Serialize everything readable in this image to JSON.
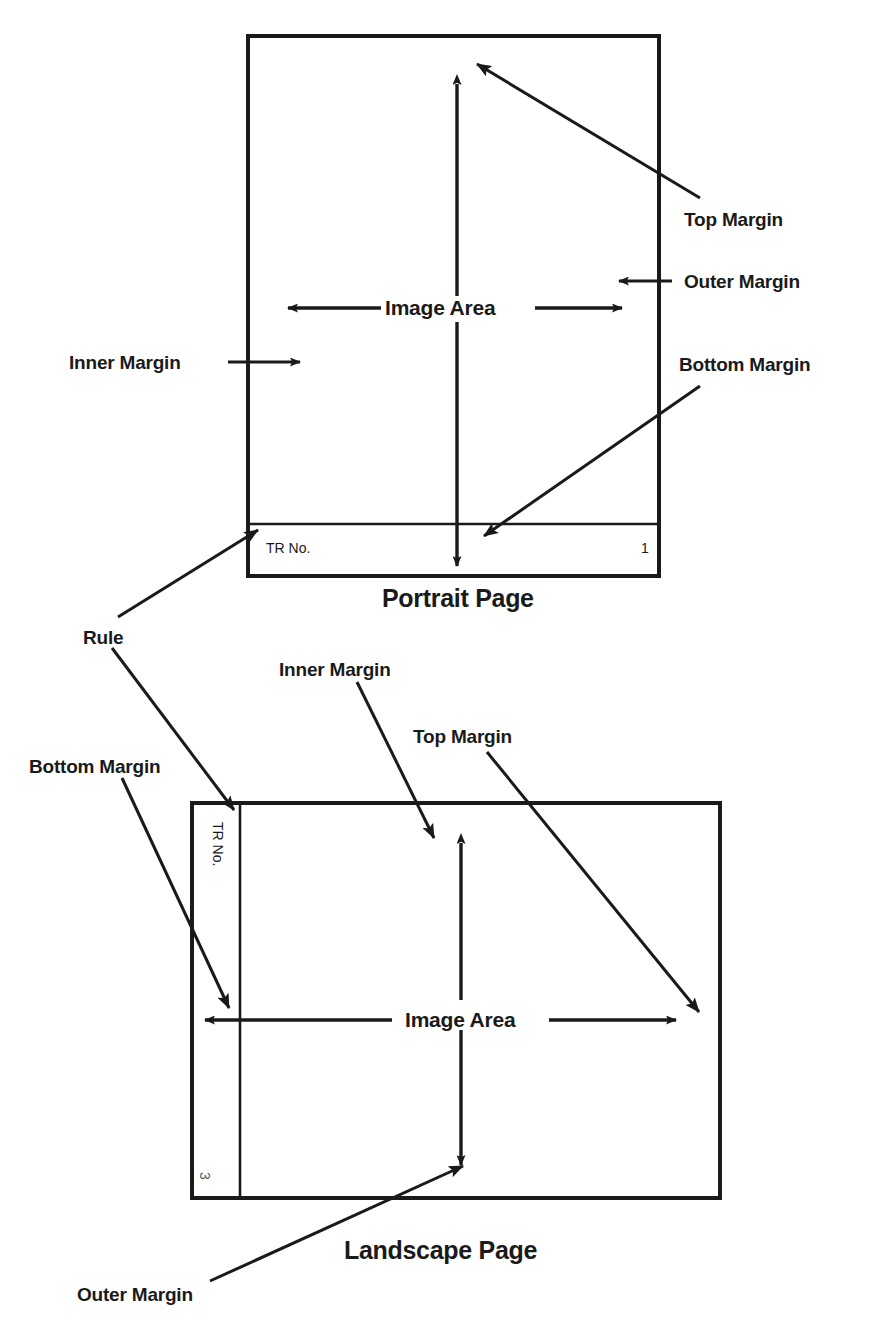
{
  "diagram": {
    "line_color": "#1a1a1a",
    "text_color": "#1a1a1a",
    "background": "#ffffff"
  },
  "portrait": {
    "caption": "Portrait Page",
    "image_area_label": "Image Area",
    "footer_text": "TR No.",
    "page_number": "1",
    "callouts": {
      "top_margin": "Top Margin",
      "outer_margin": "Outer Margin",
      "inner_margin": "Inner Margin",
      "bottom_margin": "Bottom Margin"
    }
  },
  "landscape": {
    "caption": "Landscape Page",
    "image_area_label": "Image Area",
    "footer_text": "TR No.",
    "page_number": "3",
    "callouts": {
      "rule": "Rule",
      "inner_margin": "Inner Margin",
      "top_margin": "Top Margin",
      "bottom_margin": "Bottom Margin",
      "outer_margin": "Outer Margin"
    }
  }
}
